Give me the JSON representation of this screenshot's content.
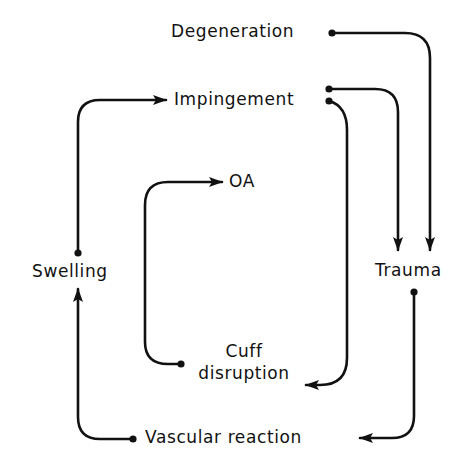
{
  "diagram": {
    "type": "flow-cycle",
    "colors": {
      "line": "#111111",
      "background": "#ffffff",
      "text": "#111111"
    },
    "nodes": {
      "degeneration": {
        "label": "Degeneration"
      },
      "impingement": {
        "label": "Impingement"
      },
      "oa": {
        "label": "OA"
      },
      "swelling": {
        "label": "Swelling"
      },
      "trauma": {
        "label": "Trauma"
      },
      "cuff_disruption": {
        "line1": "Cuff",
        "line2": "disruption"
      },
      "vascular_reaction": {
        "label": "Vascular reaction"
      }
    },
    "edges": [
      {
        "from": "Degeneration",
        "to": "Trauma"
      },
      {
        "from": "Impingement",
        "to": "Trauma"
      },
      {
        "from": "Impingement",
        "to": "Cuff disruption"
      },
      {
        "from": "Cuff disruption",
        "to": "OA"
      },
      {
        "from": "Trauma",
        "to": "Vascular reaction"
      },
      {
        "from": "Vascular reaction",
        "to": "Swelling"
      },
      {
        "from": "Swelling",
        "to": "Impingement"
      }
    ]
  }
}
